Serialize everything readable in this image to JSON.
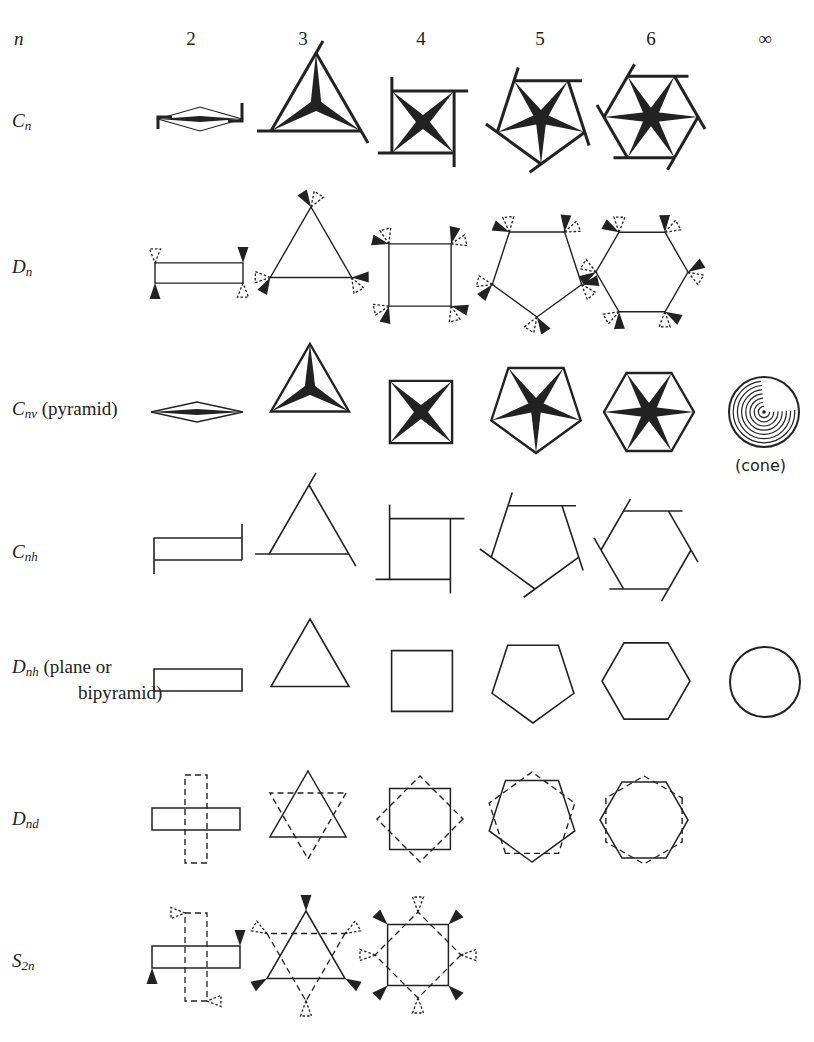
{
  "header": {
    "n_label": "n",
    "columns": [
      {
        "label": "2",
        "x": 191
      },
      {
        "label": "3",
        "x": 303
      },
      {
        "label": "4",
        "x": 421
      },
      {
        "label": "5",
        "x": 540
      },
      {
        "label": "6",
        "x": 651
      },
      {
        "label": "∞",
        "x": 765
      }
    ]
  },
  "rows": [
    {
      "id": "Cn",
      "symbol": "C",
      "sub": "n",
      "note": "",
      "y": 122,
      "note2": ""
    },
    {
      "id": "Dn",
      "symbol": "D",
      "sub": "n",
      "note": "",
      "y": 268,
      "note2": ""
    },
    {
      "id": "Cnv",
      "symbol": "C",
      "sub": "nv",
      "note": " (pyramid)",
      "y": 410,
      "note2": ""
    },
    {
      "id": "Cnh",
      "symbol": "C",
      "sub": "nh",
      "note": "",
      "y": 553,
      "note2": ""
    },
    {
      "id": "Dnh",
      "symbol": "D",
      "sub": "nh",
      "note": " (plane or",
      "y": 668,
      "note2": "bipyramid)"
    },
    {
      "id": "Dnd",
      "symbol": "D",
      "sub": "nd",
      "note": "",
      "y": 820,
      "note2": ""
    },
    {
      "id": "S2n",
      "symbol": "S",
      "sub": "2n",
      "note": "",
      "y": 962,
      "note2": ""
    }
  ],
  "cone_label": "(cone)",
  "colors": {
    "ink": "#222222",
    "background": "#ffffff"
  },
  "cells": [
    {
      "row": "Cn",
      "type": "Cn",
      "n": 2,
      "cx": 200,
      "cy": 119,
      "r": 42,
      "flat": 0.2
    },
    {
      "row": "Cn",
      "type": "Cn",
      "n": 3,
      "cx": 316,
      "cy": 105,
      "r": 52
    },
    {
      "row": "Cn",
      "type": "Cn",
      "n": 4,
      "cx": 423,
      "cy": 122,
      "r": 44
    },
    {
      "row": "Cn",
      "type": "Cn",
      "n": 5,
      "cx": 541,
      "cy": 118,
      "r": 46
    },
    {
      "row": "Cn",
      "type": "Cn",
      "n": 6,
      "cx": 651,
      "cy": 117,
      "r": 47
    },
    {
      "row": "Dn",
      "type": "Dn",
      "n": 2,
      "cx": 199,
      "cy": 273,
      "r": 44,
      "flat": 0.23
    },
    {
      "row": "Dn",
      "type": "Dn",
      "n": 3,
      "cx": 311,
      "cy": 254,
      "r": 47
    },
    {
      "row": "Dn",
      "type": "Dn",
      "n": 4,
      "cx": 420,
      "cy": 275,
      "r": 44
    },
    {
      "row": "Dn",
      "type": "Dn",
      "n": 5,
      "cx": 537,
      "cy": 270,
      "r": 47
    },
    {
      "row": "Dn",
      "type": "Dn",
      "n": 6,
      "cx": 642,
      "cy": 272,
      "r": 46
    },
    {
      "row": "Cnv",
      "type": "Cnv",
      "n": 2,
      "cx": 197,
      "cy": 412,
      "r": 46,
      "flat": 0.2
    },
    {
      "row": "Cnv",
      "type": "Cnv",
      "n": 3,
      "cx": 310,
      "cy": 389,
      "r": 45
    },
    {
      "row": "Cnv",
      "type": "Cnv",
      "n": 4,
      "cx": 421,
      "cy": 412,
      "r": 44
    },
    {
      "row": "Cnv",
      "type": "Cnv",
      "n": 5,
      "cx": 536,
      "cy": 406,
      "r": 47
    },
    {
      "row": "Cnv",
      "type": "Cnv",
      "n": 6,
      "cx": 649,
      "cy": 412,
      "r": 45
    },
    {
      "row": "Cnv",
      "type": "cone",
      "n": 0,
      "cx": 764,
      "cy": 412,
      "r": 35
    },
    {
      "row": "Cnh",
      "type": "Cnh",
      "n": 2,
      "cx": 198,
      "cy": 549,
      "r": 44,
      "flat": 0.25
    },
    {
      "row": "Cnh",
      "type": "Cnh",
      "n": 3,
      "cx": 309,
      "cy": 531,
      "r": 46
    },
    {
      "row": "Cnh",
      "type": "Cnh",
      "n": 4,
      "cx": 420,
      "cy": 549,
      "r": 43
    },
    {
      "row": "Cnh",
      "type": "Cnh",
      "n": 5,
      "cx": 535,
      "cy": 543,
      "r": 46
    },
    {
      "row": "Cnh",
      "type": "Cnh",
      "n": 6,
      "cx": 646,
      "cy": 550,
      "r": 45
    },
    {
      "row": "Dnh",
      "type": "Dnh",
      "n": 2,
      "cx": 198,
      "cy": 680,
      "r": 44,
      "flat": 0.25
    },
    {
      "row": "Dnh",
      "type": "Dnh",
      "n": 3,
      "cx": 310,
      "cy": 664,
      "r": 45
    },
    {
      "row": "Dnh",
      "type": "Dnh",
      "n": 4,
      "cx": 422,
      "cy": 681,
      "r": 43
    },
    {
      "row": "Dnh",
      "type": "Dnh",
      "n": 5,
      "cx": 533,
      "cy": 680,
      "r": 43
    },
    {
      "row": "Dnh",
      "type": "Dnh",
      "n": 6,
      "cx": 646,
      "cy": 681,
      "r": 44
    },
    {
      "row": "Dnh",
      "type": "circle",
      "n": 0,
      "cx": 765,
      "cy": 682,
      "r": 35
    },
    {
      "row": "Dnd",
      "type": "Dnd",
      "n": 2,
      "cx": 196,
      "cy": 819,
      "r": 44,
      "flat": 0.25
    },
    {
      "row": "Dnd",
      "type": "Dnd",
      "n": 3,
      "cx": 308,
      "cy": 815,
      "r": 44
    },
    {
      "row": "Dnd",
      "type": "Dnd",
      "n": 4,
      "cx": 420,
      "cy": 819,
      "r": 43
    },
    {
      "row": "Dnd",
      "type": "Dnd",
      "n": 5,
      "cx": 532,
      "cy": 817,
      "r": 45
    },
    {
      "row": "Dnd",
      "type": "Dnd",
      "n": 6,
      "cx": 644,
      "cy": 820,
      "r": 44
    },
    {
      "row": "S2n",
      "type": "S2n",
      "n": 2,
      "cx": 196,
      "cy": 957,
      "r": 44,
      "flat": 0.25
    },
    {
      "row": "S2n",
      "type": "S2n",
      "n": 3,
      "cx": 306,
      "cy": 956,
      "r": 45
    },
    {
      "row": "S2n",
      "type": "S2n",
      "n": 4,
      "cx": 418,
      "cy": 955,
      "r": 43
    }
  ]
}
